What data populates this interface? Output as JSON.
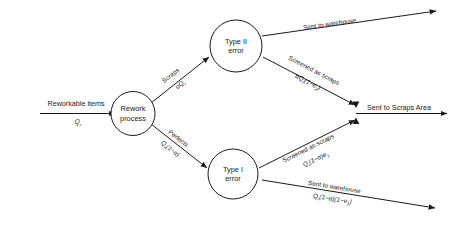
{
  "diagram": {
    "colors": {
      "stroke": "#1a1a1a",
      "background": "#ffffff"
    },
    "nodes": [
      {
        "id": "rework-process",
        "label_line1": "Rework",
        "label_line2": "process"
      },
      {
        "id": "type-ii-error",
        "label_line1": "Type II",
        "label_line2": "error"
      },
      {
        "id": "type-i-error",
        "label_line1": "Type I",
        "label_line2": "error"
      }
    ],
    "edges": [
      {
        "id": "input",
        "label": "Reworkable items",
        "formula_main": "Q",
        "formula_sub": "r"
      },
      {
        "id": "scraps-to-type-ii",
        "label": "Scraps",
        "formula_main": "αQ",
        "formula_sub": "r"
      },
      {
        "id": "perfects-to-type-i",
        "label": "Perfects",
        "formula_main": "Q",
        "formula_sub": "r",
        "formula_tail": "(1−α)"
      },
      {
        "id": "type-ii-warehouse",
        "label": "Sent to warehouse",
        "formula_main": "",
        "formula_sub": "",
        "formula_tail": ""
      },
      {
        "id": "type-ii-screened-scraps",
        "label": "Screened as scraps",
        "formula_main": "αQ",
        "formula_sub": "r",
        "formula_tail": "(1−e",
        "formula_sub2": "2",
        "formula_tail2": ")"
      },
      {
        "id": "type-i-screened-scraps",
        "label": "Screened as scraps",
        "formula_main": "Q",
        "formula_sub": "r",
        "formula_tail": "(1−α)e",
        "formula_sub2": "1"
      },
      {
        "id": "type-i-warehouse",
        "label": "Sent to warehouse",
        "formula_main": "Q",
        "formula_sub": "r",
        "formula_tail": "(1−α)(1−e",
        "formula_sub2": "1",
        "formula_tail2": ")"
      },
      {
        "id": "scraps-area-output",
        "label": "Sent to Scraps Area"
      }
    ]
  }
}
